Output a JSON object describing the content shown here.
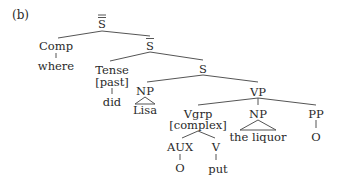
{
  "figure_label": "(b)",
  "nodes": {
    "root": {
      "label": "S",
      "bars": 2
    },
    "comp": {
      "label": "Comp"
    },
    "comp_word": {
      "label": "where"
    },
    "sbar": {
      "label": "S",
      "bars": 1
    },
    "tense": {
      "label": "Tense"
    },
    "tense_feature": {
      "label": "[past]"
    },
    "tense_word": {
      "label": "did"
    },
    "s": {
      "label": "S"
    },
    "np_subj": {
      "label": "NP"
    },
    "np_subj_word": {
      "label": "Lisa"
    },
    "vp": {
      "label": "VP"
    },
    "vgrp": {
      "label": "Vgrp"
    },
    "vgrp_feature": {
      "label": "[complex]"
    },
    "aux": {
      "label": "AUX"
    },
    "aux_word": {
      "label": "O"
    },
    "v": {
      "label": "V"
    },
    "v_word": {
      "label": "put"
    },
    "np_obj": {
      "label": "NP"
    },
    "np_obj_word": {
      "label": "the liquor"
    },
    "pp": {
      "label": "PP"
    },
    "pp_word": {
      "label": "O"
    }
  }
}
